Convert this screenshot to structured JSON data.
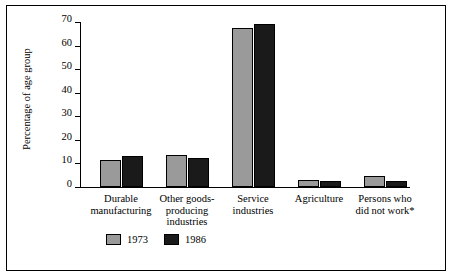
{
  "chart_data": {
    "type": "bar",
    "title": "",
    "xlabel": "",
    "ylabel": "Percentage of age group",
    "ylim": [
      0,
      70
    ],
    "yticks": [
      0,
      10,
      20,
      30,
      40,
      50,
      60,
      70
    ],
    "grid": false,
    "legend_position": "bottom",
    "categories": [
      "Durable manufacturing",
      "Other goods-producing industries",
      "Service industries",
      "Agriculture",
      "Persons who did not work*"
    ],
    "category_lines": [
      [
        "Durable",
        "manufacturing"
      ],
      [
        "Other goods-",
        "producing",
        "industries"
      ],
      [
        "Service",
        "industries"
      ],
      [
        "Agriculture"
      ],
      [
        "Persons who",
        "did not work*"
      ]
    ],
    "series": [
      {
        "name": "1973",
        "color": "#9a9a9a",
        "values": [
          11.5,
          13.5,
          67.5,
          3.0,
          4.5
        ]
      },
      {
        "name": "1986",
        "color": "#1a1a1a",
        "values": [
          13.0,
          12.5,
          69.0,
          2.5,
          2.5
        ]
      }
    ]
  }
}
